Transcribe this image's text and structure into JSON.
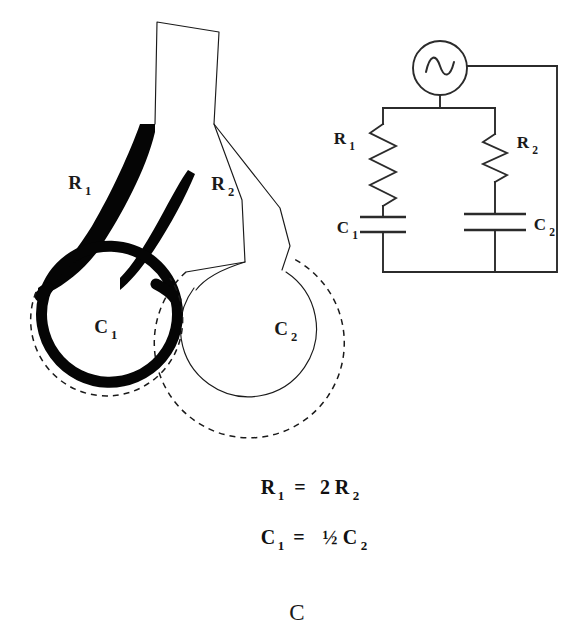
{
  "figure": {
    "panel_letter": "C",
    "domain": "respiratory-mechanics-electrical-analogue"
  },
  "lung_model": {
    "title_labels": {
      "airway_left": "R",
      "airway_left_sub": "1",
      "airway_right": "R",
      "airway_right_sub": "2",
      "alveolus_left": "C",
      "alveolus_left_sub": "1",
      "alveolus_right": "C",
      "alveolus_right_sub": "2"
    },
    "description": "Two-compartment lung unit: a common trachea branching into a narrow high-resistance airway (R1, drawn filled black) feeding a small stiff alveolus (C1) and a wide low-resistance airway (R2) feeding a large compliant alveolus (C2); dashed outlines show the inflated end-inspiratory position."
  },
  "circuit": {
    "source": {
      "name": "ac-voltage-source",
      "glyph": "sine"
    },
    "components": [
      {
        "id": "R1",
        "letter": "R",
        "sub": "1",
        "type": "resistor",
        "branch": "left"
      },
      {
        "id": "C1",
        "letter": "C",
        "sub": "1",
        "type": "capacitor",
        "branch": "left"
      },
      {
        "id": "R2",
        "letter": "R",
        "sub": "2",
        "type": "resistor",
        "branch": "right"
      },
      {
        "id": "C2",
        "letter": "C",
        "sub": "2",
        "type": "capacitor",
        "branch": "right"
      }
    ]
  },
  "equations": [
    {
      "id": "resistance-relation",
      "lhs_letter": "R",
      "lhs_sub": "1",
      "operator": "=",
      "rhs_coefficient": "2",
      "rhs_letter": "R",
      "rhs_sub": "2",
      "plain": "R1 = 2R2"
    },
    {
      "id": "compliance-relation",
      "lhs_letter": "C",
      "lhs_sub": "1",
      "operator": "=",
      "rhs_coefficient": "½",
      "rhs_letter": "C",
      "rhs_sub": "2",
      "plain": "C1 = ½C2"
    }
  ],
  "colors": {
    "ink": "#1a1a1a",
    "fill_black": "#050505",
    "wire": "#2b2b2b",
    "background": "#ffffff"
  }
}
